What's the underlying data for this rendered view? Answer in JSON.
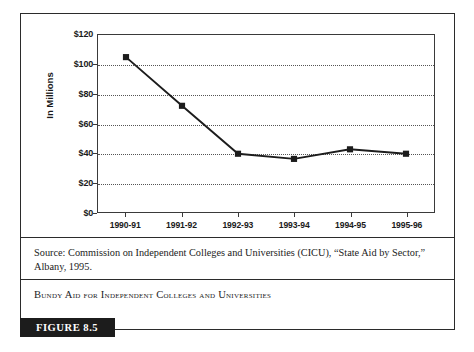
{
  "figure": {
    "badge_label": "FIGURE 8.5",
    "caption": "Bundy Aid for Independent Colleges and Universities",
    "source": "Source: Commission on Independent Colleges and Universities (CICU), “State Aid by Sector,” Albany, 1995.",
    "border_color": "#2b2b2b"
  },
  "chart_data": {
    "type": "line",
    "title": "",
    "xlabel": "",
    "ylabel": "In Millions",
    "categories": [
      "1990-91",
      "1991-92",
      "1992-93",
      "1993-94",
      "1994-95",
      "1995-96"
    ],
    "values": [
      105,
      72,
      39.5,
      36,
      42.5,
      39.5
    ],
    "series": [
      {
        "name": "Bundy Aid",
        "values": [
          105,
          72,
          39.5,
          36,
          42.5,
          39.5
        ]
      }
    ],
    "ylim": [
      0,
      120
    ],
    "ytick_values": [
      0,
      20,
      40,
      60,
      80,
      100,
      120
    ],
    "ytick_labels": [
      "$0",
      "$20",
      "$40",
      "$60",
      "$80",
      "$100",
      "$120"
    ],
    "grid": true,
    "grid_style": "dotted-horizontal",
    "legend": "none",
    "line_color": "#1c1c1c",
    "marker_color": "#1c1c1c",
    "marker_shape": "square"
  }
}
